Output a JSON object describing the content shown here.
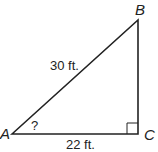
{
  "diagram": {
    "type": "right-triangle",
    "vertices": {
      "A": {
        "label": "A",
        "x": 12,
        "y": 134
      },
      "B": {
        "label": "B",
        "x": 138,
        "y": 20
      },
      "C": {
        "label": "C",
        "x": 138,
        "y": 134
      }
    },
    "sides": {
      "hypotenuse": {
        "from": "A",
        "to": "B",
        "label": "30 ft."
      },
      "base": {
        "from": "A",
        "to": "C",
        "label": "22 ft."
      }
    },
    "angle_A": {
      "label": "?"
    },
    "right_angle_at": "C",
    "stroke_color": "#222222"
  }
}
